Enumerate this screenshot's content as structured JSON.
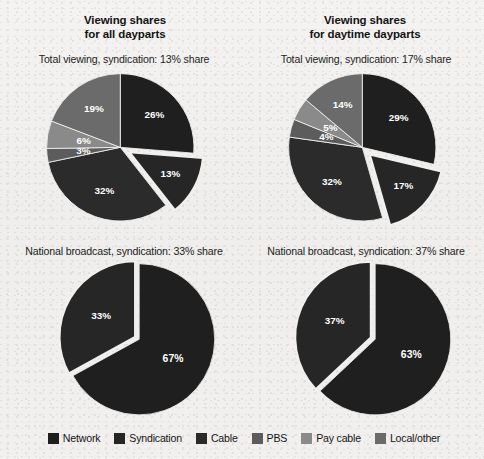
{
  "figure": {
    "background_color": "#f1f0ee",
    "columns": [
      {
        "title_line1": "Viewing shares",
        "title_line2": "for all dayparts"
      },
      {
        "title_line1": "Viewing shares",
        "title_line2": "for daytime dayparts"
      }
    ]
  },
  "legend": {
    "position": "bottom-center",
    "items": [
      {
        "label": "Network",
        "color": "#1f1f1f"
      },
      {
        "label": "Syndication",
        "color": "#262626"
      },
      {
        "label": "Cable",
        "color": "#2b2b2b"
      },
      {
        "label": "PBS",
        "color": "#5c5c5c"
      },
      {
        "label": "Pay cable",
        "color": "#8a8a8a"
      },
      {
        "label": "Local/other",
        "color": "#6b6b6b"
      }
    ]
  },
  "chart_data": [
    {
      "id": "total-all-dayparts",
      "type": "pie",
      "title": "Total viewing, syndication: 13% share",
      "column": "Viewing shares for all dayparts",
      "row": "Total viewing",
      "start_angle_deg": 0,
      "direction": "clockwise",
      "categories": [
        "Network",
        "Syndication",
        "Cable",
        "PBS",
        "Pay cable",
        "Local/other"
      ],
      "values": [
        26,
        13,
        32,
        3,
        6,
        19
      ],
      "labels": [
        "26%",
        "13%",
        "32%",
        "3%",
        "6%",
        "19%"
      ],
      "colors": [
        "#1f1f1f",
        "#262626",
        "#2b2b2b",
        "#5c5c5c",
        "#8a8a8a",
        "#6b6b6b"
      ],
      "exploded": [
        "Syndication"
      ],
      "highlight_value": 13,
      "highlight_label": "13% share"
    },
    {
      "id": "total-daytime-dayparts",
      "type": "pie",
      "title": "Total viewing, syndication: 17% share",
      "column": "Viewing shares for daytime dayparts",
      "row": "Total viewing",
      "start_angle_deg": 0,
      "direction": "clockwise",
      "categories": [
        "Network",
        "Syndication",
        "Cable",
        "PBS",
        "Pay cable",
        "Local/other"
      ],
      "values": [
        29,
        17,
        32,
        4,
        5,
        14
      ],
      "labels": [
        "29%",
        "17%",
        "32%",
        "4%",
        "5%",
        "14%"
      ],
      "colors": [
        "#1f1f1f",
        "#262626",
        "#2b2b2b",
        "#5c5c5c",
        "#8a8a8a",
        "#6b6b6b"
      ],
      "exploded": [
        "Syndication"
      ],
      "highlight_value": 17,
      "highlight_label": "17% share"
    },
    {
      "id": "national-all-dayparts",
      "type": "pie",
      "title": "National broadcast, syndication: 33% share",
      "column": "Viewing shares for all dayparts",
      "row": "National broadcast",
      "start_angle_deg": 0,
      "direction": "clockwise",
      "categories": [
        "Network",
        "Syndication"
      ],
      "values": [
        67,
        33
      ],
      "labels": [
        "67%",
        "33%"
      ],
      "colors": [
        "#1f1f1f",
        "#262626"
      ],
      "exploded": [
        "Syndication"
      ],
      "highlight_value": 33,
      "highlight_label": "33% share"
    },
    {
      "id": "national-daytime-dayparts",
      "type": "pie",
      "title": "National broadcast, syndication: 37% share",
      "column": "Viewing shares for daytime dayparts",
      "row": "National broadcast",
      "start_angle_deg": 0,
      "direction": "clockwise",
      "categories": [
        "Network",
        "Syndication"
      ],
      "values": [
        63,
        37
      ],
      "labels": [
        "63%",
        "37%"
      ],
      "colors": [
        "#1f1f1f",
        "#262626"
      ],
      "exploded": [
        "Syndication"
      ],
      "highlight_value": 37,
      "highlight_label": "37% share"
    }
  ]
}
